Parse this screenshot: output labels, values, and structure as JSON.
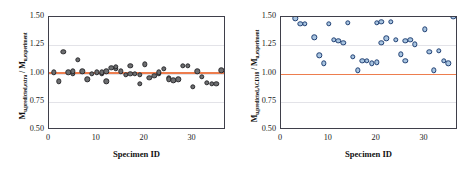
{
  "figure": {
    "background": "#ffffff",
    "panel_count": 2
  },
  "style": {
    "gray_marker_fill": "#6d6e70",
    "gray_marker_edge": "#2b2b2e",
    "blue_marker_fill": "#a8c4e0",
    "blue_marker_edge": "#1f3f73",
    "reference_line_color": "#ed7d4e",
    "axis_color": "#3f3f4a",
    "grid_color": "#e3e3e8"
  },
  "chart_data": [
    {
      "type": "scatter",
      "panel": "left",
      "title": "",
      "xlabel": "Specimen ID",
      "ylabel_plain": "Mu,predicted,extra / Mu,experiment",
      "ylabel_main1": "M",
      "ylabel_sub1": "u,predicted,extra",
      "ylabel_sep": " / ",
      "ylabel_main2": "M",
      "ylabel_sub2": "u,experiment",
      "xlim": [
        0,
        37
      ],
      "ylim": [
        0.5,
        1.5
      ],
      "xticks": [
        0,
        10,
        20,
        30
      ],
      "yticks": [
        "0.50",
        "0.75",
        "1.00",
        "1.25",
        "1.50"
      ],
      "ytick_values": [
        0.5,
        0.75,
        1.0,
        1.25,
        1.5
      ],
      "gridlines_y": [
        0.75,
        1.0,
        1.25
      ],
      "grid": true,
      "legend": "none",
      "reference_line_y": 1.01,
      "x": [
        1,
        2,
        3,
        4,
        5,
        5,
        6,
        7,
        8,
        9,
        10,
        11,
        11,
        12,
        12,
        13,
        14,
        14,
        15,
        16,
        17,
        17,
        18,
        19,
        19,
        20,
        21,
        22,
        23,
        23,
        24,
        25,
        25,
        26,
        27,
        28,
        29,
        30,
        31,
        32,
        33,
        34,
        35,
        36
      ],
      "y": [
        1.01,
        0.93,
        1.19,
        1.01,
        1.0,
        1.02,
        1.12,
        1.02,
        0.95,
        1.0,
        1.01,
        1.0,
        1.01,
        0.93,
        1.02,
        1.05,
        1.04,
        1.06,
        1.02,
        0.99,
        1.0,
        1.07,
        1.0,
        0.91,
        0.99,
        1.08,
        0.96,
        0.98,
        1.0,
        1.01,
        1.04,
        0.96,
        0.95,
        0.94,
        0.95,
        1.07,
        1.07,
        0.88,
        1.02,
        0.97,
        0.92,
        0.91,
        0.91,
        1.03
      ]
    },
    {
      "type": "scatter",
      "panel": "right",
      "title": "",
      "xlabel": "Specimen ID",
      "ylabel_plain": "Mu,predicted,ACI318 / Mu,experiment",
      "ylabel_main1": "M",
      "ylabel_sub1": "u,predicted,ACI318",
      "ylabel_sep": " / ",
      "ylabel_main2": "M",
      "ylabel_sub2": "u,experiment",
      "xlim": [
        0,
        37
      ],
      "ylim": [
        0.5,
        1.5
      ],
      "xticks": [
        0,
        10,
        20,
        30
      ],
      "yticks": [
        "0.50",
        "0.75",
        "1.00",
        "1.25",
        "1.50"
      ],
      "ytick_values": [
        0.5,
        0.75,
        1.0,
        1.25,
        1.5
      ],
      "gridlines_y": [
        0.75,
        1.0,
        1.25
      ],
      "grid": true,
      "legend": "none",
      "reference_line_y": 1.0,
      "x": [
        3,
        4,
        5,
        7,
        8,
        9,
        10,
        11,
        12,
        13,
        14,
        15,
        16,
        17,
        18,
        19,
        20,
        20,
        21,
        21,
        22,
        23,
        24,
        25,
        26,
        26,
        27,
        28,
        30,
        31,
        32,
        33,
        34,
        35,
        36
      ],
      "y": [
        1.49,
        1.44,
        1.44,
        1.32,
        1.16,
        1.09,
        1.44,
        1.3,
        1.29,
        1.27,
        1.45,
        1.15,
        1.03,
        1.11,
        1.11,
        1.09,
        1.45,
        1.1,
        1.46,
        1.27,
        1.31,
        1.46,
        1.3,
        1.17,
        1.29,
        1.11,
        1.3,
        1.26,
        1.39,
        1.19,
        1.03,
        1.2,
        1.11,
        1.09
      ]
    }
  ]
}
